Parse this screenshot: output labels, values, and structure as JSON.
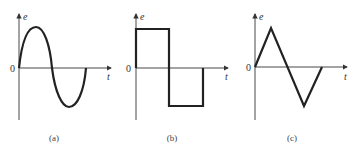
{
  "panels": [
    {
      "id": "a",
      "caption": "(a)",
      "y_label": "e",
      "x_label": "t",
      "origin_label": "0",
      "waveform": "sine"
    },
    {
      "id": "b",
      "caption": "(b)",
      "y_label": "e",
      "x_label": "t",
      "origin_label": "0",
      "waveform": "square"
    },
    {
      "id": "c",
      "caption": "(c)",
      "y_label": "e",
      "x_label": "t",
      "origin_label": "0",
      "waveform": "triangle"
    }
  ],
  "colors": {
    "stroke": "#222222",
    "axis": "#333333",
    "background": "#ffffff"
  }
}
